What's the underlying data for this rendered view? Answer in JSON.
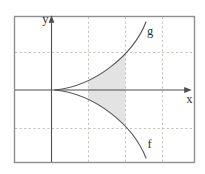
{
  "figure": {
    "y_axis_label": "y",
    "x_axis_label": "x",
    "g_label": "g",
    "f_label": "f"
  },
  "colors": {
    "background": "#ffffff",
    "frame": "#8f8f8f",
    "grid": "#c7c3bd",
    "axis": "#4e4e4e",
    "curve": "#585858",
    "shading": "#e3e3e3",
    "label": "#333333"
  }
}
